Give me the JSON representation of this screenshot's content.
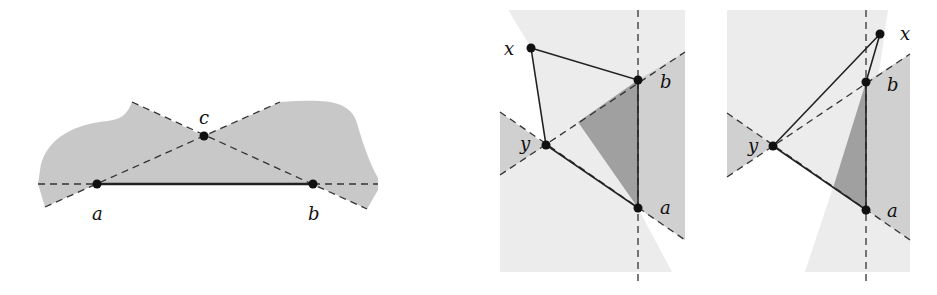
{
  "figures": [
    {
      "id": "left",
      "description": "Gray region with segment ab and point c where dashed lines cross",
      "points": {
        "a": {
          "label": "a",
          "x": 97,
          "y": 184
        },
        "b": {
          "label": "b",
          "x": 313,
          "y": 184
        },
        "c": {
          "label": "c",
          "x": 204,
          "y": 136
        }
      },
      "colors": {
        "region": "#c8c8c8",
        "segment": "#222222",
        "dashed": "#555555"
      }
    },
    {
      "id": "middle",
      "description": "Triangle x-b-y with segment ab, shaded wedges",
      "points": {
        "x": {
          "label": "x",
          "x": 531,
          "y": 48
        },
        "b": {
          "label": "b",
          "x": 638,
          "y": 80
        },
        "y": {
          "label": "y",
          "x": 546,
          "y": 145
        },
        "a": {
          "label": "a",
          "x": 638,
          "y": 208
        }
      },
      "colors": {
        "light": "#ececec",
        "mid": "#d0d0d0",
        "dark": "#a0a0a0"
      }
    },
    {
      "id": "right",
      "description": "Triangle x-b-y with segment ab, x outside above b",
      "points": {
        "x": {
          "label": "x",
          "x": 880,
          "y": 34
        },
        "b": {
          "label": "b",
          "x": 866,
          "y": 82
        },
        "y": {
          "label": "y",
          "x": 773,
          "y": 146
        },
        "a": {
          "label": "a",
          "x": 866,
          "y": 210
        }
      },
      "colors": {
        "light": "#ececec",
        "mid": "#d0d0d0",
        "dark": "#a0a0a0"
      }
    }
  ]
}
